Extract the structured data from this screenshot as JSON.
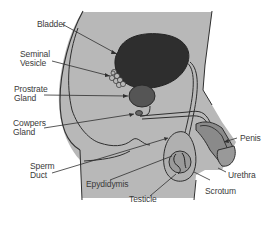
{
  "diagram": {
    "colors": {
      "background": "#ffffff",
      "body_fill": "#b8b8b8",
      "outline": "#2f2f2f",
      "bladder": "#2e2e2e",
      "prostate": "#555555",
      "penis_tissue": "#8a8a8a",
      "label_text": "#3a3a3a"
    },
    "labels": [
      {
        "id": "bladder",
        "line1": "Bladder",
        "line2": ""
      },
      {
        "id": "seminal-vesicle",
        "line1": "Seminal",
        "line2": "Vesicle"
      },
      {
        "id": "prostrate-gland",
        "line1": "Prostrate",
        "line2": "Gland"
      },
      {
        "id": "cowpers-gland",
        "line1": "Cowpers",
        "line2": "Gland"
      },
      {
        "id": "sperm-duct",
        "line1": "Sperm",
        "line2": "Duct"
      },
      {
        "id": "epydidymis",
        "line1": "Epydidymis",
        "line2": ""
      },
      {
        "id": "testicle",
        "line1": "Testicle",
        "line2": ""
      },
      {
        "id": "scrotum",
        "line1": "Scrotum",
        "line2": ""
      },
      {
        "id": "urethra",
        "line1": "Urethra",
        "line2": ""
      },
      {
        "id": "penis",
        "line1": "Penis",
        "line2": ""
      }
    ]
  }
}
